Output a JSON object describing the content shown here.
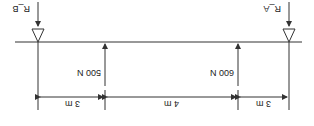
{
  "diagram": {
    "orientation": "rotated 180 degrees",
    "supports": [
      {
        "id": "left",
        "label": "R_B",
        "x": 38
      },
      {
        "id": "right",
        "label": "R_A",
        "x": 289
      }
    ],
    "loads": [
      {
        "id": "left-load",
        "label": "500 N",
        "x": 105
      },
      {
        "id": "right-load",
        "label": "600 N",
        "x": 238
      }
    ],
    "dimensions": [
      {
        "label": "3 m",
        "from": 38,
        "to": 105
      },
      {
        "label": "4 m",
        "from": 105,
        "to": 238
      },
      {
        "label": "3 m",
        "from": 238,
        "to": 289
      }
    ],
    "colors": {
      "line": "#333333",
      "background": "#ffffff"
    }
  }
}
